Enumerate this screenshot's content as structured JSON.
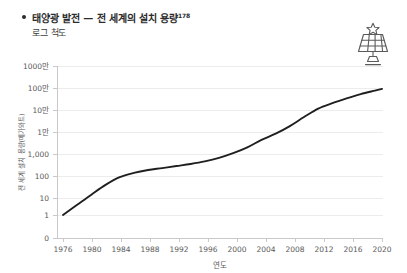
{
  "header": {
    "bullet_icon": "bullet-dot",
    "title": "태양광 발전 — 전 세계의 설치 용량",
    "footnote_marker": "178",
    "subtitle": "로그 척도"
  },
  "icon": {
    "name": "solar-panel-icon",
    "label": "태양광 패널"
  },
  "chart_data": {
    "type": "line",
    "title": "태양광 발전 — 전 세계의 설치 용량",
    "subtitle": "로그 척도",
    "xlabel": "연도",
    "ylabel": "전 세계 설치 용량(메가와트)",
    "y_scale": "log",
    "grid": true,
    "legend": false,
    "xlim": [
      1976,
      2021
    ],
    "ylim": [
      1,
      10000000
    ],
    "x_ticks": [
      1976,
      1980,
      1984,
      1988,
      1992,
      1996,
      2000,
      2004,
      2008,
      2012,
      2016,
      2020
    ],
    "x_tick_labels": [
      "1976",
      "1980",
      "1984",
      "1988",
      "1992",
      "1996",
      "2000",
      "2004",
      "2008",
      "2012",
      "2016",
      "2020"
    ],
    "y_ticks": [
      0,
      1,
      10,
      100,
      1000,
      10000,
      100000,
      1000000,
      10000000
    ],
    "y_tick_labels": [
      "0",
      "1",
      "10",
      "100",
      "1,000",
      "1만",
      "10만",
      "100만",
      "1000만"
    ],
    "series": [
      {
        "name": "전 세계 설치 용량",
        "color": "#1f1f1f",
        "x": [
          1976,
          1978,
          1980,
          1982,
          1984,
          1986,
          1988,
          1990,
          1992,
          1994,
          1996,
          1998,
          2000,
          2002,
          2004,
          2006,
          2008,
          2010,
          2012,
          2014,
          2016,
          2018,
          2020,
          2021
        ],
        "values": [
          1,
          3,
          9,
          26,
          60,
          95,
          130,
          160,
          200,
          250,
          330,
          480,
          800,
          1500,
          3400,
          6600,
          15000,
          40000,
          100000,
          180000,
          300000,
          480000,
          700000,
          840000
        ]
      }
    ]
  }
}
